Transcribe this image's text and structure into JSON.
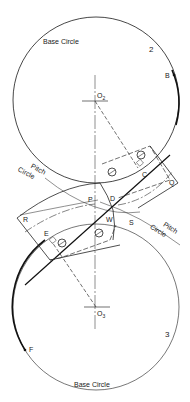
{
  "figure": {
    "type": "gear-involute-diagram",
    "gears": [
      {
        "id": "2",
        "number_label": "2",
        "center_label": "O",
        "center_subscript": "2",
        "base_circle_label": "Base Circle"
      },
      {
        "id": "3",
        "number_label": "3",
        "center_label": "O",
        "center_subscript": "3",
        "base_circle_label": "Base Circle"
      }
    ],
    "pitch_circle_labels": [
      {
        "line1": "Pitch",
        "line2": "Circle",
        "position": "upper-left"
      },
      {
        "line1": "Pitch",
        "line2": "Circle",
        "position": "lower-right"
      }
    ],
    "points": {
      "B": "B",
      "C": "C",
      "D": "D",
      "E": "E",
      "F": "F",
      "P": "P",
      "Q": "Q",
      "R": "R",
      "S": "S",
      "W": "W"
    }
  },
  "colors": {
    "line": "#1a1a1a",
    "thin_line": "#555555",
    "background": "#ffffff"
  }
}
